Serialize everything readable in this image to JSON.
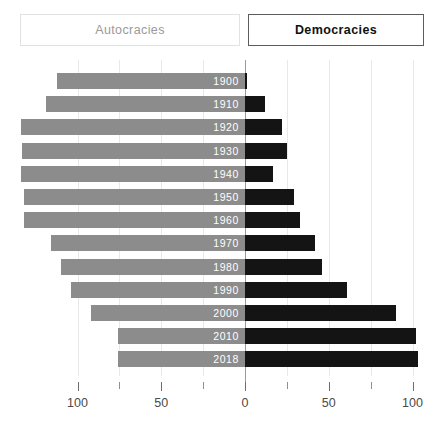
{
  "toggles": {
    "left_label": "Autocracies",
    "right_label": "Democracies"
  },
  "axis": {
    "tick_labels": [
      "100",
      "50",
      "0",
      "50",
      "100"
    ],
    "tick_values": [
      -100,
      -50,
      0,
      50,
      100
    ]
  },
  "colors": {
    "autocracies": "#8c8c8c",
    "democracies": "#141414",
    "background": "#ffffff",
    "gridline": "#e8e8e8",
    "zero_axis": "#9a9a9a"
  },
  "chart_data": {
    "type": "bar",
    "title": "",
    "subtitle": "",
    "xlabel": "",
    "ylabel": "",
    "orientation": "horizontal",
    "layout": "diverging-population-pyramid",
    "grid": true,
    "legend_position": "top",
    "xlim": [
      -100,
      100
    ],
    "categories": [
      "1900",
      "1910",
      "1920",
      "1930",
      "1940",
      "1950",
      "1960",
      "1970",
      "1980",
      "1990",
      "2000",
      "2010",
      "2018"
    ],
    "series": [
      {
        "name": "Autocracies",
        "direction": "left",
        "values": [
          112,
          119,
          134,
          133,
          134,
          132,
          132,
          116,
          110,
          104,
          92,
          76,
          76
        ]
      },
      {
        "name": "Democracies",
        "direction": "right",
        "values": [
          1,
          12,
          22,
          25,
          17,
          29,
          33,
          42,
          46,
          61,
          90,
          102,
          103
        ]
      }
    ],
    "rows": [
      {
        "year": "1900",
        "autocracies": 112,
        "democracies": 1
      },
      {
        "year": "1910",
        "autocracies": 119,
        "democracies": 12
      },
      {
        "year": "1920",
        "autocracies": 134,
        "democracies": 22
      },
      {
        "year": "1930",
        "autocracies": 133,
        "democracies": 25
      },
      {
        "year": "1940",
        "autocracies": 134,
        "democracies": 17
      },
      {
        "year": "1950",
        "autocracies": 132,
        "democracies": 29
      },
      {
        "year": "1960",
        "autocracies": 132,
        "democracies": 33
      },
      {
        "year": "1970",
        "autocracies": 116,
        "democracies": 42
      },
      {
        "year": "1980",
        "autocracies": 110,
        "democracies": 46
      },
      {
        "year": "1990",
        "autocracies": 104,
        "democracies": 61
      },
      {
        "year": "2000",
        "autocracies": 92,
        "democracies": 90
      },
      {
        "year": "2010",
        "autocracies": 76,
        "democracies": 102
      },
      {
        "year": "2018",
        "autocracies": 76,
        "democracies": 103
      }
    ]
  }
}
